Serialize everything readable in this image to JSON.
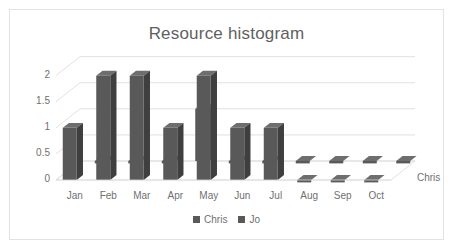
{
  "chart_data": {
    "type": "bar",
    "title": "Resource histogram",
    "xlabel": "",
    "ylabel": "",
    "zlabel": "Chris",
    "categories": [
      "Jan",
      "Feb",
      "Mar",
      "Apr",
      "May",
      "Jun",
      "Jul",
      "Aug",
      "Sep",
      "Oct"
    ],
    "series": [
      {
        "name": "Chris",
        "values": [
          1,
          2,
          2,
          1,
          2,
          1,
          1,
          0,
          0,
          0
        ],
        "color": "#595959"
      },
      {
        "name": "Jo",
        "values": [
          0,
          0,
          0,
          1,
          0,
          0,
          0,
          0,
          0,
          0
        ],
        "color": "#595959"
      }
    ],
    "ylim": [
      0,
      2.3
    ],
    "yticks": [
      "0",
      "0.5",
      "1",
      "1.5",
      "2"
    ],
    "ytick_values": [
      0,
      0.5,
      1,
      1.5,
      2
    ],
    "grid": true,
    "legend_position": "bottom",
    "three_d": true
  },
  "chart": {
    "title": "Resource histogram",
    "depth_axis_label": "Chris",
    "legend": [
      {
        "label": "Chris",
        "color": "#595959"
      },
      {
        "label": "Jo",
        "color": "#595959"
      }
    ]
  },
  "colors": {
    "bar_front": "#595959",
    "bar_side": "#3f3f3f",
    "bar_top": "#6e6e6e",
    "grid": "#d9d9d9",
    "text": "#707070",
    "title": "#5f5f5f",
    "border": "#e2e2e2",
    "background": "#ffffff"
  }
}
